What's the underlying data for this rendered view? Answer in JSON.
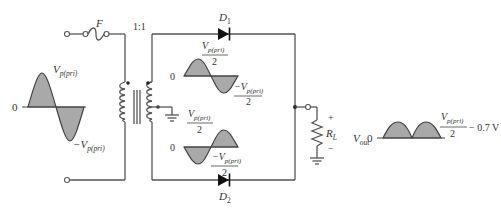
{
  "colors": {
    "wire": "#555555",
    "waveform_fill": "#a9a9a9",
    "text": "#333333",
    "background": "#ffffff"
  },
  "input": {
    "fuse_label": "F",
    "peak_label_main": "V",
    "peak_label_sub": "p(pri)",
    "neg_peak_label_main": "−V",
    "neg_peak_label_sub": "p(pri)",
    "zero_label": "0"
  },
  "transformer": {
    "ratio_label": "1:1"
  },
  "secondary_top_wave": {
    "zero_label": "0",
    "pos_label_main": "V",
    "pos_label_sub": "p(pri)",
    "pos_label_den": "2",
    "neg_label_main": "−V",
    "neg_label_sub": "p(pri)",
    "neg_label_den": "2"
  },
  "secondary_bottom_wave": {
    "zero_label": "0",
    "pos_label_main": "V",
    "pos_label_sub": "p(pri)",
    "pos_label_den": "2",
    "neg_label_main": "−V",
    "neg_label_sub": "p(pri)",
    "neg_label_den": "2"
  },
  "diodes": {
    "d1_main": "D",
    "d1_sub": "1",
    "d2_main": "D",
    "d2_sub": "2"
  },
  "load": {
    "label_main": "R",
    "label_sub": "L",
    "plus": "+",
    "minus": "−"
  },
  "output": {
    "vout_main": "V",
    "vout_sub": "out",
    "zero_label": "0",
    "peak_num_main": "V",
    "peak_num_sub": "p(pri)",
    "peak_den": "2",
    "peak_suffix": "− 0.7 V"
  }
}
